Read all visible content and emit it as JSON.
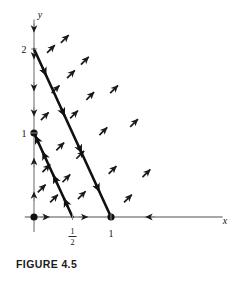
{
  "figure": {
    "caption": "FIGURE 4.5",
    "colors": {
      "axis": "#8a8a8a",
      "trajectory": "#111111",
      "arrow": "#1a1a1a",
      "text": "#111111",
      "background": "#ffffff"
    }
  },
  "chart_data": {
    "type": "scatter",
    "title": "FIGURE 4.5",
    "xlabel": "x",
    "ylabel": "y",
    "xlim": [
      -0.12,
      2.45
    ],
    "ylim": [
      -0.18,
      2.35
    ],
    "grid": false,
    "legend": null,
    "xticks": [
      {
        "value": 0.5,
        "label": "1/2",
        "numerator": "1",
        "denominator": "2"
      },
      {
        "value": 1,
        "label": "1"
      }
    ],
    "yticks": [
      {
        "value": 1,
        "label": "1"
      },
      {
        "value": 2,
        "label": "2"
      }
    ],
    "equilibria": [
      {
        "x": 0,
        "y": 0,
        "label": "origin",
        "marker": "filled-dot"
      },
      {
        "x": 0,
        "y": 1,
        "label": "(0,1)",
        "marker": "filled-dot"
      },
      {
        "x": 1,
        "y": 0,
        "label": "(1,0)",
        "marker": "filled-dot"
      }
    ],
    "trajectories": [
      {
        "name": "outer-line",
        "from": {
          "x": 0,
          "y": 2
        },
        "to": {
          "x": 1,
          "y": 0
        },
        "direction": "toward-x-axis",
        "arrow_fractions": [
          0.16,
          0.4,
          0.62,
          0.85
        ]
      },
      {
        "name": "inner-line",
        "from": {
          "x": 0.5,
          "y": 0
        },
        "to": {
          "x": 0,
          "y": 1
        },
        "direction": "toward-y-axis",
        "arrow_fractions": [
          0.22,
          0.5,
          0.78,
          0.97
        ]
      }
    ],
    "axis_flow_arrows": [
      {
        "axis": "y",
        "at": 1.88,
        "direction": "down"
      },
      {
        "axis": "y",
        "at": 1.5,
        "direction": "down"
      },
      {
        "axis": "y",
        "at": 1.2,
        "direction": "down"
      },
      {
        "axis": "y",
        "at": 2.2,
        "direction": "down"
      },
      {
        "axis": "y",
        "at": 0.7,
        "direction": "up"
      },
      {
        "axis": "y",
        "at": 0.3,
        "direction": "up"
      },
      {
        "axis": "x",
        "at": 0.2,
        "direction": "right"
      },
      {
        "axis": "x",
        "at": 0.7,
        "direction": "right"
      },
      {
        "axis": "x",
        "at": 1.45,
        "direction": "left"
      }
    ],
    "direction_field": [
      {
        "x": 0.22,
        "y": 2.0,
        "angle_deg": 45
      },
      {
        "x": 0.4,
        "y": 2.12,
        "angle_deg": 45
      },
      {
        "x": 0.66,
        "y": 1.86,
        "angle_deg": 45
      },
      {
        "x": 0.48,
        "y": 1.7,
        "angle_deg": 45
      },
      {
        "x": 0.28,
        "y": 1.52,
        "angle_deg": 45
      },
      {
        "x": 0.73,
        "y": 1.44,
        "angle_deg": 45
      },
      {
        "x": 0.52,
        "y": 1.22,
        "angle_deg": 45
      },
      {
        "x": 0.14,
        "y": 1.2,
        "angle_deg": 45
      },
      {
        "x": 1.04,
        "y": 1.52,
        "angle_deg": 45
      },
      {
        "x": 1.3,
        "y": 1.12,
        "angle_deg": 45
      },
      {
        "x": 0.9,
        "y": 1.02,
        "angle_deg": 45
      },
      {
        "x": 0.34,
        "y": 0.84,
        "angle_deg": 45
      },
      {
        "x": 0.6,
        "y": 0.74,
        "angle_deg": 45
      },
      {
        "x": 0.16,
        "y": 0.58,
        "angle_deg": 45
      },
      {
        "x": 0.42,
        "y": 0.46,
        "angle_deg": 45
      },
      {
        "x": 0.1,
        "y": 0.34,
        "angle_deg": 45
      },
      {
        "x": 0.26,
        "y": 0.22,
        "angle_deg": 45
      },
      {
        "x": 0.62,
        "y": 0.26,
        "angle_deg": 45
      },
      {
        "x": 1.02,
        "y": 0.56,
        "angle_deg": 45
      },
      {
        "x": 1.46,
        "y": 0.52,
        "angle_deg": 45
      },
      {
        "x": 1.22,
        "y": 0.22,
        "angle_deg": 45
      }
    ]
  }
}
